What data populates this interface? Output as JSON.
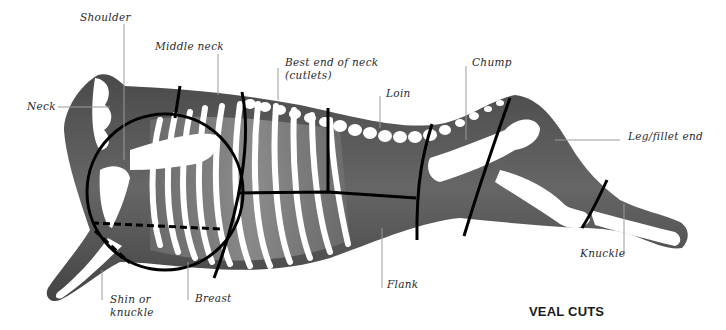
{
  "title": "VEAL CUTS",
  "labels": {
    "shoulder": "Shoulder",
    "middle_neck": "Middle neck",
    "best_end_line1": "Best end of neck",
    "best_end_line2": "(cutlets)",
    "chump": "Chump",
    "loin": "Loin",
    "neck": "Neck",
    "leg": "Leg/fillet end",
    "knuckle": "Knuckle",
    "flank": "Flank",
    "shin_line1": "Shin or",
    "shin_line2": "knuckle",
    "breast": "Breast"
  },
  "colors": {
    "body": "#5a5a5a",
    "body_dark": "#3e3e3e",
    "muscle": "#8a8a8a",
    "bone": "#ffffff",
    "cut_line": "#000000",
    "leader": "#9a9a9a"
  }
}
